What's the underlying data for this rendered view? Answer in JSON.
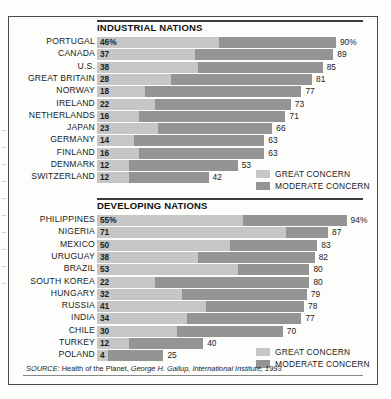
{
  "chart_data": {
    "type": "bar",
    "subtype": "stacked-horizontal",
    "title": "",
    "xlabel": "",
    "ylabel": "",
    "xlim": [
      0,
      100
    ],
    "grid": false,
    "legend_position": "inside-right",
    "series": [
      {
        "name": "GREAT CONCERN",
        "color": "#c6c6c6"
      },
      {
        "name": "MODERATE CONCERN",
        "color": "#949494"
      }
    ],
    "panels": [
      {
        "title": "INDUSTRIAL NATIONS",
        "categories": [
          "PORTUGAL",
          "CANADA",
          "U.S.",
          "GREAT BRITAIN",
          "NORWAY",
          "IRELAND",
          "NETHERLANDS",
          "JAPAN",
          "GERMANY",
          "FINLAND",
          "DENMARK",
          "SWITZERLAND"
        ],
        "great": [
          46,
          37,
          38,
          28,
          18,
          22,
          16,
          23,
          14,
          16,
          12,
          12
        ],
        "total": [
          90,
          89,
          85,
          81,
          77,
          73,
          71,
          66,
          63,
          63,
          53,
          42
        ],
        "start_labels": [
          "46%",
          "37",
          "38",
          "28",
          "18",
          "22",
          "16",
          "23",
          "14",
          "16",
          "12",
          "12"
        ],
        "end_labels": [
          "90%",
          "89",
          "85",
          "81",
          "77",
          "73",
          "71",
          "66",
          "63",
          "63",
          "53",
          "42"
        ]
      },
      {
        "title": "DEVELOPING NATIONS",
        "categories": [
          "PHILIPPINES",
          "NIGERIA",
          "MEXICO",
          "URUGUAY",
          "BRAZIL",
          "SOUTH KOREA",
          "HUNGARY",
          "RUSSIA",
          "INDIA",
          "CHILE",
          "TURKEY",
          "POLAND"
        ],
        "great": [
          55,
          71,
          50,
          38,
          53,
          22,
          32,
          41,
          34,
          30,
          12,
          4
        ],
        "total": [
          94,
          87,
          83,
          82,
          80,
          80,
          79,
          78,
          77,
          70,
          40,
          25
        ],
        "start_labels": [
          "55%",
          "71",
          "50",
          "38",
          "53",
          "22",
          "32",
          "41",
          "34",
          "30",
          "12",
          "4"
        ],
        "end_labels": [
          "94%",
          "87",
          "83",
          "82",
          "80",
          "80",
          "79",
          "78",
          "77",
          "70",
          "40",
          "25"
        ]
      }
    ]
  },
  "legend": {
    "great_label": "GREAT CONCERN",
    "moderate_label": "MODERATE CONCERN"
  },
  "source": {
    "lead": "SOURCE:",
    "publication": " Health of the Planet, ",
    "cite": "George H. Gallup, International Institute, 1993"
  }
}
